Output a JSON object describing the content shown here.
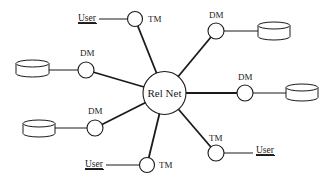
{
  "center": {
    "label": "Rel Net",
    "x": 164.5,
    "y": 93,
    "r": 21.5
  },
  "colors": {
    "stroke": "#1a1a1a",
    "background": "#ffffff"
  },
  "nodes": [
    {
      "id": "tm-top",
      "type": "TM",
      "label": "TM",
      "x": 135,
      "y": 19,
      "r": 7.5,
      "label_x": 148,
      "label_y": 22,
      "user": {
        "label": "User",
        "text_x": 78,
        "text_y": 21,
        "line_x1": 99,
        "line_x2": 127.5,
        "line_y": 19
      }
    },
    {
      "id": "dm-top-left",
      "type": "DM",
      "label": "DM",
      "x": 86,
      "y": 70,
      "r": 8,
      "label_x": 80,
      "label_y": 56,
      "db": {
        "x": 16,
        "y": 60,
        "w": 33,
        "h": 17
      }
    },
    {
      "id": "dm-bottom-left",
      "type": "DM",
      "label": "DM",
      "x": 95,
      "y": 128,
      "r": 8,
      "label_x": 88,
      "label_y": 114,
      "db": {
        "x": 23,
        "y": 120,
        "w": 32,
        "h": 17
      }
    },
    {
      "id": "tm-bottom",
      "type": "TM",
      "label": "TM",
      "x": 147,
      "y": 165,
      "r": 7.5,
      "label_x": 159,
      "label_y": 168,
      "user": {
        "label": "User",
        "text_x": 85,
        "text_y": 167,
        "line_x1": 106,
        "line_x2": 139.5,
        "line_y": 165
      }
    },
    {
      "id": "dm-top-right",
      "type": "DM",
      "label": "DM",
      "x": 216,
      "y": 31,
      "r": 8,
      "label_x": 209,
      "label_y": 18,
      "db": {
        "x": 258,
        "y": 22,
        "w": 32,
        "h": 18
      }
    },
    {
      "id": "dm-right",
      "type": "DM",
      "label": "DM",
      "x": 245,
      "y": 93,
      "r": 8,
      "label_x": 238,
      "label_y": 80,
      "db": {
        "x": 286,
        "y": 84,
        "w": 32,
        "h": 17
      }
    },
    {
      "id": "tm-bottom-right",
      "type": "TM",
      "label": "TM",
      "x": 216,
      "y": 153,
      "r": 8,
      "label_x": 209,
      "label_y": 141,
      "user": {
        "label": "User",
        "text_x": 256,
        "text_y": 153,
        "line_x1": 224,
        "line_x2": 253,
        "line_y": 153
      }
    }
  ]
}
